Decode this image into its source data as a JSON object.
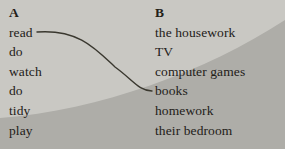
{
  "exercise": {
    "type": "matching",
    "column_a": {
      "header": "A",
      "items": [
        "read",
        "do",
        "watch",
        "do",
        "tidy",
        "play"
      ]
    },
    "column_b": {
      "header": "B",
      "items": [
        "the housework",
        "TV",
        "computer games",
        "books",
        "homework",
        "their bedroom"
      ]
    },
    "connections": [
      {
        "from": "read",
        "to": "books"
      }
    ]
  },
  "palette": {
    "background_light": "#c9c8c3",
    "background_dark": "#aeada8",
    "text": "#232018",
    "connector_line": "#3a382f"
  }
}
